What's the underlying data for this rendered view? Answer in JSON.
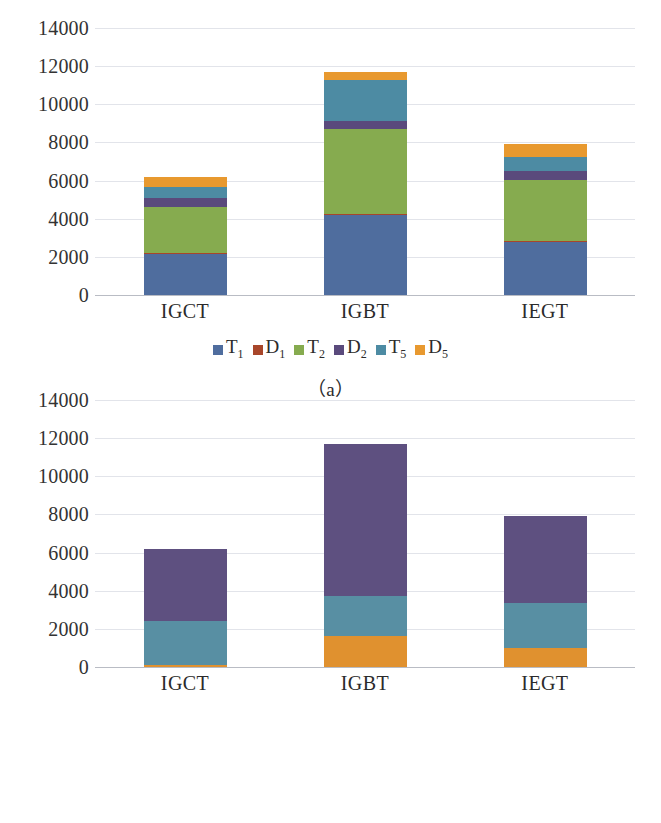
{
  "figure": {
    "panels": [
      {
        "id": "a",
        "caption": "（a）",
        "chart_index": 0
      },
      {
        "id": "b",
        "caption": "（b）",
        "chart_index": 1
      }
    ]
  },
  "palette": {
    "T1": "#4f6d9e",
    "D1": "#a8462a",
    "T2": "#86ab4f",
    "D2": "#5a4a7c",
    "T5": "#4d8ba3",
    "D5": "#e8992f",
    "kaitong": "#e0912f",
    "guanduan": "#588fa3",
    "daotong": "#5e5080",
    "gridline": "#e2e4ea",
    "axis": "#b9bcc4",
    "text": "#2b2b2b"
  },
  "chart_data": [
    {
      "type": "bar",
      "stacked": true,
      "title": "",
      "subtitle": "（a）",
      "xlabel": "",
      "ylabel": "",
      "categories": [
        "IGCT",
        "IGBT",
        "IEGT"
      ],
      "ylim": [
        0,
        14000
      ],
      "yticks": [
        0,
        2000,
        4000,
        6000,
        8000,
        10000,
        12000,
        14000
      ],
      "ytick_labels": [
        "0",
        "2000",
        "4000",
        "6000",
        "8000",
        "10000",
        "12000",
        "14000"
      ],
      "grid": true,
      "legend_position": "bottom",
      "series": [
        {
          "name": "T1",
          "label": "T",
          "sub": "1",
          "color": "#4f6d9e",
          "values": [
            2150,
            4200,
            2800
          ]
        },
        {
          "name": "D1",
          "label": "D",
          "sub": "1",
          "color": "#a8462a",
          "values": [
            30,
            40,
            30
          ]
        },
        {
          "name": "T2",
          "label": "T",
          "sub": "2",
          "color": "#86ab4f",
          "values": [
            2420,
            4450,
            3200
          ]
        },
        {
          "name": "D2",
          "label": "D",
          "sub": "2",
          "color": "#5a4a7c",
          "values": [
            500,
            450,
            500
          ]
        },
        {
          "name": "T5",
          "label": "T",
          "sub": "5",
          "color": "#4d8ba3",
          "values": [
            550,
            2120,
            700
          ]
        },
        {
          "name": "D5",
          "label": "D",
          "sub": "5",
          "color": "#e8992f",
          "values": [
            550,
            440,
            670
          ]
        }
      ],
      "totals": [
        6200,
        11700,
        7900
      ]
    },
    {
      "type": "bar",
      "stacked": true,
      "title": "",
      "subtitle": "（b）",
      "xlabel": "",
      "ylabel": "",
      "categories": [
        "IGCT",
        "IGBT",
        "IEGT"
      ],
      "ylim": [
        0,
        14000
      ],
      "yticks": [
        0,
        2000,
        4000,
        6000,
        8000,
        10000,
        12000,
        14000
      ],
      "ytick_labels": [
        "0",
        "2000",
        "4000",
        "6000",
        "8000",
        "10000",
        "12000",
        "14000"
      ],
      "grid": true,
      "legend_position": "bottom",
      "series": [
        {
          "name": "kaitong",
          "label": "开通",
          "color": "#e0912f",
          "values": [
            110,
            1650,
            1010
          ]
        },
        {
          "name": "guanduan",
          "label": "关断",
          "color": "#588fa3",
          "values": [
            2290,
            2060,
            2340
          ]
        },
        {
          "name": "daotong",
          "label": "导通",
          "color": "#5e5080",
          "values": [
            3800,
            7990,
            4550
          ]
        }
      ],
      "totals": [
        6200,
        11700,
        7900
      ]
    }
  ]
}
